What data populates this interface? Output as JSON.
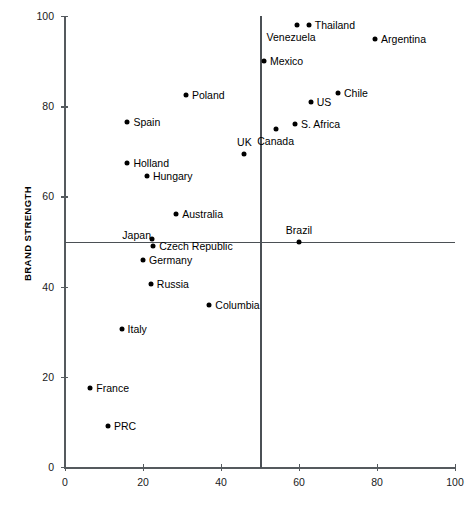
{
  "chart_data": {
    "type": "scatter",
    "title": "",
    "xlabel": "",
    "ylabel": "BRAND STRENGTH",
    "xlim": [
      0,
      100
    ],
    "ylim": [
      0,
      100
    ],
    "xticks": [
      0,
      20,
      40,
      60,
      80,
      100
    ],
    "yticks": [
      0,
      20,
      40,
      60,
      80,
      100
    ],
    "xtick_labels": [
      "0",
      "20",
      "40",
      "60",
      "80",
      "100"
    ],
    "ytick_labels": [
      "0",
      "20",
      "40",
      "60",
      "80",
      "100"
    ],
    "grid": false,
    "legend": "none",
    "reference_lines": [
      {
        "orientation": "vertical",
        "value": 50
      },
      {
        "orientation": "horizontal",
        "value": 50
      }
    ],
    "points": [
      {
        "label": "Thailand",
        "x": 62.5,
        "y": 98.0,
        "anchor": "right"
      },
      {
        "label": "Venezuela",
        "x": 59.5,
        "y": 98.0,
        "anchor": "below-left"
      },
      {
        "label": "Argentina",
        "x": 79.5,
        "y": 95.0,
        "anchor": "right"
      },
      {
        "label": "Mexico",
        "x": 51.0,
        "y": 90.0,
        "anchor": "right"
      },
      {
        "label": "Poland",
        "x": 31.0,
        "y": 82.5,
        "anchor": "right"
      },
      {
        "label": "Chile",
        "x": 70.0,
        "y": 83.0,
        "anchor": "right"
      },
      {
        "label": "US",
        "x": 63.0,
        "y": 81.0,
        "anchor": "right"
      },
      {
        "label": "Spain",
        "x": 16.0,
        "y": 76.5,
        "anchor": "right"
      },
      {
        "label": "S. Africa",
        "x": 59.0,
        "y": 76.0,
        "anchor": "right"
      },
      {
        "label": "Canada",
        "x": 54.0,
        "y": 75.0,
        "anchor": "below"
      },
      {
        "label": "UK",
        "x": 46.0,
        "y": 69.5,
        "anchor": "above"
      },
      {
        "label": "Holland",
        "x": 16.0,
        "y": 67.5,
        "anchor": "right"
      },
      {
        "label": "Hungary",
        "x": 21.0,
        "y": 64.5,
        "anchor": "right"
      },
      {
        "label": "Australia",
        "x": 28.5,
        "y": 56.0,
        "anchor": "right"
      },
      {
        "label": "Japan",
        "x": 22.3,
        "y": 50.5,
        "anchor": "above-left"
      },
      {
        "label": "Czech Republic",
        "x": 22.6,
        "y": 49.0,
        "anchor": "right"
      },
      {
        "label": "Brazil",
        "x": 60.0,
        "y": 50.0,
        "anchor": "above"
      },
      {
        "label": "Germany",
        "x": 20.0,
        "y": 46.0,
        "anchor": "right"
      },
      {
        "label": "Russia",
        "x": 22.0,
        "y": 40.5,
        "anchor": "right"
      },
      {
        "label": "Columbia",
        "x": 37.0,
        "y": 36.0,
        "anchor": "right"
      },
      {
        "label": "Italy",
        "x": 14.5,
        "y": 30.5,
        "anchor": "right"
      },
      {
        "label": "France",
        "x": 6.5,
        "y": 17.5,
        "anchor": "right"
      },
      {
        "label": "PRC",
        "x": 11.0,
        "y": 9.0,
        "anchor": "right"
      }
    ]
  }
}
